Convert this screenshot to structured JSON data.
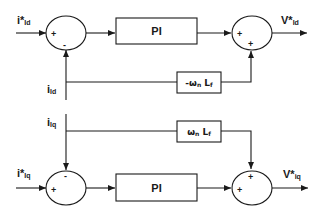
{
  "diagram": {
    "d_axis": {
      "reference_input": {
        "main": "i*",
        "sub": "Id"
      },
      "feedback_input": {
        "main": "i",
        "sub": "Id"
      },
      "sum1_signs": {
        "left": "+",
        "bottom": "-"
      },
      "controller": "PI",
      "decoupling_gain": {
        "prefix": "-ω",
        "sub1": "n",
        "mid": " L",
        "sub2": "f"
      },
      "sum2_signs": {
        "left": "+",
        "bottom": "+"
      },
      "output": {
        "main": "V*",
        "sub": "Id"
      }
    },
    "q_axis": {
      "feedback_input": {
        "main": "i",
        "sub": "Iq"
      },
      "reference_input": {
        "main": "i*",
        "sub": "Iq"
      },
      "sum1_signs": {
        "left": "+",
        "top": "-"
      },
      "controller": "PI",
      "decoupling_gain": {
        "prefix": "ω",
        "sub1": "n",
        "mid": " L",
        "sub2": "f"
      },
      "sum2_signs": {
        "left": "+",
        "top": "+"
      },
      "output": {
        "main": "V*",
        "sub": "iq"
      }
    }
  }
}
